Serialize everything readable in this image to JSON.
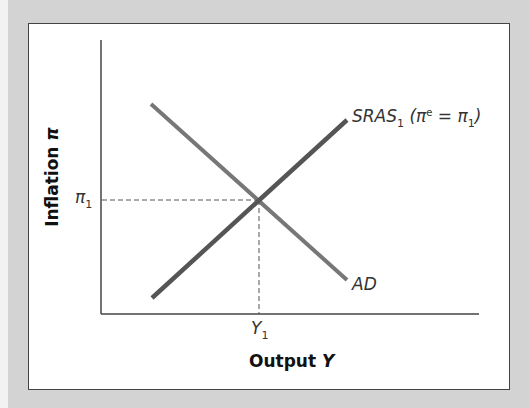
{
  "diagram": {
    "type": "AD-AS model",
    "x_axis_title": "Output",
    "x_axis_symbol": "Y",
    "y_axis_title": "Inflation",
    "y_axis_symbol": "π",
    "x_tick": {
      "base": "Y",
      "sub": "1"
    },
    "y_tick": {
      "base": "π",
      "sub": "1"
    },
    "curves": [
      {
        "name": "AD",
        "label": "AD",
        "color": "#777777",
        "slope": "downward"
      },
      {
        "name": "SRAS1",
        "label_base": "SRAS",
        "label_sub": "1",
        "label_paren_open": "(π",
        "label_sup": "e",
        "label_eq": " = π",
        "label_eq_sub": "1",
        "label_paren_close": ")",
        "color": "#555555",
        "slope": "upward"
      }
    ],
    "equilibrium": {
      "x": "Y1",
      "y": "π1"
    }
  },
  "colors": {
    "background": "#d3d3d3",
    "frame": "#ffffff",
    "axis": "#444444",
    "ad_line": "#777777",
    "sras_line": "#555555"
  }
}
